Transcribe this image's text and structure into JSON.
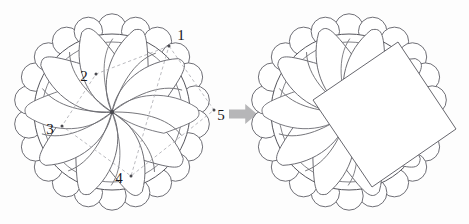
{
  "figure": {
    "background_color": "#fdfdfd",
    "ink_color": "#5a5a5e",
    "dash_color": "#a9a9b0",
    "arrow_color": "#b6b6b8",
    "overlay_fill": "#ffffff"
  },
  "left_panel": {
    "name": "spiral-rosette-with-measurement-points",
    "center": {
      "x": 112,
      "y": 112
    },
    "outer_ring": {
      "count": 22,
      "ring_radius": 84,
      "circle_radius": 14.2,
      "start_angle_deg": -90
    },
    "main_circle": {
      "cx": 112,
      "cy": 112,
      "r": 78
    },
    "inner_circle": {
      "cx": 112,
      "cy": 112,
      "r": 70
    },
    "petals": {
      "count": 10,
      "description": "teardrop spiral arms converging at center",
      "spin_deg": 36,
      "length": 72,
      "bulb_radius": 17
    },
    "center_dot": {
      "r": 2.2
    },
    "dashed_quad": {
      "stroke_dasharray": "3.2 2.6",
      "vertices": [
        {
          "label": "1",
          "x": 169,
          "y": 46,
          "label_x": 181,
          "label_y": 37
        },
        {
          "label": "2",
          "x": 96,
          "y": 74,
          "label_x": 84,
          "label_y": 78
        },
        {
          "label": "3",
          "x": 62,
          "y": 126,
          "label_x": 50,
          "label_y": 131
        },
        {
          "label": "4",
          "x": 131,
          "y": 176,
          "label_x": 119,
          "label_y": 180
        },
        {
          "label": "5",
          "x": 214,
          "y": 110,
          "label_x": 221,
          "label_y": 117
        }
      ]
    },
    "labels": [
      "1",
      "2",
      "3",
      "4",
      "5"
    ]
  },
  "transform_arrow": {
    "name": "transform-arrow",
    "direction": "right",
    "x": 229,
    "y": 104,
    "width": 28,
    "height": 20,
    "color": "#b6b6b8"
  },
  "right_panel": {
    "name": "spiral-rosette-with-rectangle-overlay",
    "center": {
      "x": 349,
      "y": 112
    },
    "outer_ring": {
      "count": 22,
      "ring_radius": 84,
      "circle_radius": 14.2,
      "start_angle_deg": -90
    },
    "main_circle": {
      "cx": 349,
      "cy": 112,
      "r": 78
    },
    "inner_circle": {
      "cx": 349,
      "cy": 112,
      "r": 70
    },
    "petals": {
      "count": 10,
      "spin_deg": 36,
      "length": 72,
      "bulb_radius": 17
    },
    "overlay_rectangle": {
      "name": "white-rotated-rectangle",
      "fill": "#ffffff",
      "stroke": "#5f5f66",
      "corners": [
        {
          "x": 398,
          "y": 42
        },
        {
          "x": 456,
          "y": 129
        },
        {
          "x": 372,
          "y": 187
        },
        {
          "x": 313,
          "y": 100
        }
      ],
      "rotation_deg": 56
    }
  }
}
